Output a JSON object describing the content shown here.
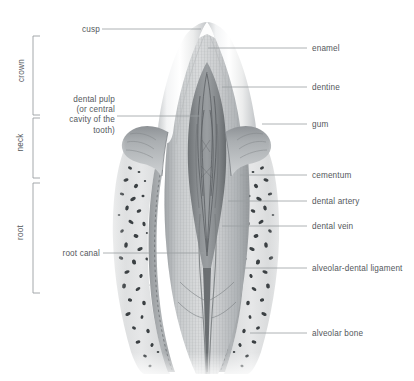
{
  "figure": {
    "background_color": "#ffffff",
    "line_color": "#8d9195",
    "text_color": "#54585c"
  },
  "brackets": [
    {
      "name": "crown",
      "label": "crown",
      "y_top": 36,
      "y_bottom": 115
    },
    {
      "name": "neck",
      "label": "neck",
      "y_top": 118,
      "y_bottom": 178
    },
    {
      "name": "root",
      "label": "root",
      "y_top": 183,
      "y_bottom": 293
    }
  ],
  "labels_left": [
    {
      "name": "cusp",
      "text": "cusp",
      "text_x": 72,
      "text_y": 25,
      "line_from_x": 102,
      "line_from_y": 29,
      "line_to_x": 201,
      "line_to_y": 29
    },
    {
      "name": "dental-pulp",
      "text": "dental pulp\n(or central\ncavity of the\ntooth)",
      "text_x": 52,
      "text_y": 95,
      "line_from_x": 117,
      "line_from_y": 116,
      "line_to_x": 200,
      "line_to_y": 116
    },
    {
      "name": "root-canal",
      "text": "root canal",
      "text_x": 57,
      "text_y": 249,
      "line_from_x": 103,
      "line_from_y": 253,
      "line_to_x": 204,
      "line_to_y": 253
    }
  ],
  "labels_right": [
    {
      "name": "enamel",
      "text": "enamel",
      "text_x": 312,
      "text_y": 44,
      "line_from_x": 208,
      "line_from_y": 48,
      "line_to_x": 307,
      "line_to_y": 48
    },
    {
      "name": "dentine",
      "text": "dentine",
      "text_x": 312,
      "text_y": 83,
      "line_from_x": 222,
      "line_from_y": 87,
      "line_to_x": 307,
      "line_to_y": 87
    },
    {
      "name": "gum",
      "text": "gum",
      "text_x": 312,
      "text_y": 120,
      "line_from_x": 262,
      "line_from_y": 124,
      "line_to_x": 307,
      "line_to_y": 124
    },
    {
      "name": "cementum",
      "text": "cementum",
      "text_x": 312,
      "text_y": 171,
      "line_from_x": 240,
      "line_from_y": 175,
      "line_to_x": 307,
      "line_to_y": 175
    },
    {
      "name": "dental-artery",
      "text": "dental artery",
      "text_x": 312,
      "text_y": 197,
      "line_from_x": 228,
      "line_from_y": 201,
      "line_to_x": 307,
      "line_to_y": 201
    },
    {
      "name": "dental-vein",
      "text": "dental vein",
      "text_x": 312,
      "text_y": 222,
      "line_from_x": 222,
      "line_from_y": 226,
      "line_to_x": 307,
      "line_to_y": 226
    },
    {
      "name": "alveolar-dental-ligament",
      "text": "alveolar-dental ligament",
      "text_x": 312,
      "text_y": 264,
      "line_from_x": 243,
      "line_from_y": 268,
      "line_to_x": 307,
      "line_to_y": 268
    },
    {
      "name": "alveolar-bone",
      "text": "alveolar bone",
      "text_x": 312,
      "text_y": 329,
      "line_from_x": 250,
      "line_from_y": 333,
      "line_to_x": 307,
      "line_to_y": 333
    }
  ],
  "anatomy_structures": [
    "enamel",
    "dentine",
    "dental pulp",
    "gum",
    "cementum",
    "root canal",
    "dental artery",
    "dental vein",
    "alveolar-dental ligament",
    "alveolar bone",
    "cusp"
  ]
}
